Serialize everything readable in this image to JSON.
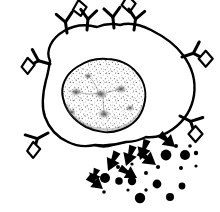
{
  "figure": {
    "style": "black-and-white line drawing",
    "background_color": "#ffffff",
    "ink_color": "#000000",
    "caption": "",
    "labels": []
  },
  "chart_data": {
    "type": "diagram",
    "xlabel": "",
    "ylabel": "",
    "canvas": {
      "width": 220,
      "height": 212
    },
    "components": [
      {
        "name": "cell-membrane",
        "kind": "outline",
        "stroke": "#000000",
        "stroke_width": 2.2,
        "fill": "#ffffff"
      },
      {
        "name": "nucleus",
        "kind": "stippled-blob",
        "stroke": "#000000",
        "stroke_width": 2.0,
        "fill": "#fcfcfc",
        "texture": "stipple"
      },
      {
        "name": "receptors",
        "kind": "y-shapes",
        "count": 8,
        "with_antigen": 6
      },
      {
        "name": "granules",
        "kind": "filled-circles",
        "count": 22
      },
      {
        "name": "arrows",
        "kind": "tapered-arrows",
        "count": 8,
        "direction": "down-right"
      }
    ],
    "membrane_path": "M 49 60 C 44 48 54 36 68 30 C 80 24 92 25 104 28 C 116 24 130 24 143 29 C 158 34 172 42 182 54 C 192 66 196 80 194 95 C 192 110 184 122 172 130 C 162 137 150 139 139 138 C 128 142 116 144 104 143 C 92 146 80 146 70 142 C 58 137 49 128 45 116 C 40 104 42 90 46 78 C 47 72 48 66 49 60 Z",
    "nucleus_path": "M 63 98 C 60 86 66 74 77 67 C 88 60 102 58 114 60 C 126 62 136 70 141 81 C 146 92 145 104 139 114 C 133 124 122 130 110 131 C 98 132 86 129 77 122 C 68 115 64 107 63 98 Z",
    "receptors": [
      {
        "id": "receptor-top-left-a",
        "x": 67,
        "y": 32,
        "angle": -8,
        "scale": 1.0,
        "antigen": true,
        "antigen_side": "right"
      },
      {
        "id": "receptor-top-left-b",
        "x": 84,
        "y": 29,
        "angle": 4,
        "scale": 0.95,
        "antigen": false,
        "antigen_side": "none"
      },
      {
        "id": "receptor-top-right-a",
        "x": 113,
        "y": 30,
        "angle": -6,
        "scale": 0.95,
        "antigen": false,
        "antigen_side": "none"
      },
      {
        "id": "receptor-top-right-b",
        "x": 131,
        "y": 30,
        "angle": 8,
        "scale": 1.0,
        "antigen": true,
        "antigen_side": "left"
      },
      {
        "id": "receptor-left-upper",
        "x": 49,
        "y": 62,
        "angle": -78,
        "scale": 1.0,
        "antigen": true,
        "antigen_side": "right"
      },
      {
        "id": "receptor-left-lower",
        "x": 47,
        "y": 134,
        "angle": -118,
        "scale": 1.0,
        "antigen": true,
        "antigen_side": "right"
      },
      {
        "id": "receptor-right-upper",
        "x": 183,
        "y": 56,
        "angle": 70,
        "scale": 1.0,
        "antigen": true,
        "antigen_side": "left"
      },
      {
        "id": "receptor-right-lower",
        "x": 181,
        "y": 116,
        "angle": 118,
        "scale": 1.0,
        "antigen": true,
        "antigen_side": "left"
      }
    ],
    "granules": [
      {
        "cx": 105,
        "cy": 178,
        "r": 5.0
      },
      {
        "cx": 119,
        "cy": 181,
        "r": 3.8
      },
      {
        "cx": 104,
        "cy": 192,
        "r": 1.8
      },
      {
        "cx": 118,
        "cy": 167,
        "r": 2.0
      },
      {
        "cx": 132,
        "cy": 181,
        "r": 4.2
      },
      {
        "cx": 132,
        "cy": 164,
        "r": 1.6
      },
      {
        "cx": 146,
        "cy": 173,
        "r": 2.0
      },
      {
        "cx": 146,
        "cy": 190,
        "r": 1.7
      },
      {
        "cx": 140,
        "cy": 198,
        "r": 5.2
      },
      {
        "cx": 157,
        "cy": 184,
        "r": 4.4
      },
      {
        "cx": 158,
        "cy": 167,
        "r": 2.1
      },
      {
        "cx": 166,
        "cy": 155,
        "r": 5.4
      },
      {
        "cx": 170,
        "cy": 197,
        "r": 4.0
      },
      {
        "cx": 182,
        "cy": 186,
        "r": 3.4
      },
      {
        "cx": 181,
        "cy": 168,
        "r": 2.0
      },
      {
        "cx": 185,
        "cy": 155,
        "r": 5.0
      },
      {
        "cx": 190,
        "cy": 146,
        "r": 1.8
      },
      {
        "cx": 196,
        "cy": 153,
        "r": 2.2
      },
      {
        "cx": 176,
        "cy": 146,
        "r": 2.0
      },
      {
        "cx": 128,
        "cy": 190,
        "r": 1.6
      },
      {
        "cx": 151,
        "cy": 159,
        "r": 1.7
      },
      {
        "cx": 196,
        "cy": 166,
        "r": 1.6
      }
    ],
    "arrows": [
      {
        "x1": 97,
        "y1": 169,
        "x2": 92,
        "y2": 182,
        "w": 4.0
      },
      {
        "x1": 117,
        "y1": 152,
        "x2": 108,
        "y2": 171,
        "w": 4.6
      },
      {
        "x1": 133,
        "y1": 146,
        "x2": 126,
        "y2": 166,
        "w": 4.6
      },
      {
        "x1": 147,
        "y1": 140,
        "x2": 140,
        "y2": 160,
        "w": 4.4
      },
      {
        "x1": 160,
        "y1": 134,
        "x2": 175,
        "y2": 147,
        "w": 4.6
      },
      {
        "x1": 139,
        "y1": 152,
        "x2": 156,
        "y2": 165,
        "w": 4.8
      },
      {
        "x1": 120,
        "y1": 168,
        "x2": 137,
        "y2": 178,
        "w": 4.4
      },
      {
        "x1": 88,
        "y1": 177,
        "x2": 103,
        "y2": 189,
        "w": 4.2
      }
    ]
  }
}
